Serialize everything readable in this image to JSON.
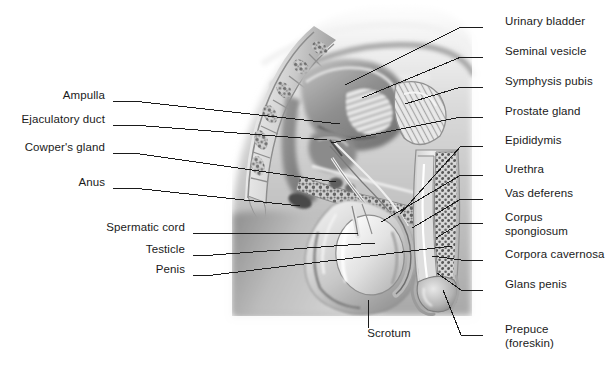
{
  "figure": {
    "width": 614,
    "height": 367,
    "background": "#ffffff",
    "leader_color": "#1a1a1a",
    "text_color": "#1a1a1a"
  },
  "labels_right": [
    {
      "id": "urinary-bladder",
      "text": "Urinary bladder",
      "x": 505,
      "y": 22,
      "stub_x": 483,
      "stub_y": 27,
      "tip_x": 345,
      "tip_y": 85
    },
    {
      "id": "seminal-vesicle",
      "text": "Seminal vesicle",
      "x": 505,
      "y": 52,
      "stub_x": 483,
      "stub_y": 57,
      "tip_x": 362,
      "tip_y": 98
    },
    {
      "id": "symphysis-pubis",
      "text": "Symphysis pubis",
      "x": 505,
      "y": 82,
      "stub_x": 483,
      "stub_y": 87,
      "tip_x": 405,
      "tip_y": 104
    },
    {
      "id": "prostate-gland",
      "text": "Prostate gland",
      "x": 505,
      "y": 112,
      "stub_x": 483,
      "stub_y": 117,
      "tip_x": 331,
      "tip_y": 143
    },
    {
      "id": "epididymis",
      "text": "Epididymis",
      "x": 505,
      "y": 141,
      "stub_x": 483,
      "stub_y": 146,
      "tip_x": 400,
      "tip_y": 214
    },
    {
      "id": "urethra",
      "text": "Urethra",
      "x": 505,
      "y": 170,
      "stub_x": 483,
      "stub_y": 175,
      "tip_x": 381,
      "tip_y": 222
    },
    {
      "id": "vas-deferens",
      "text": "Vas deferens",
      "x": 505,
      "y": 194,
      "stub_x": 483,
      "stub_y": 199,
      "tip_x": 412,
      "tip_y": 228
    },
    {
      "id": "corpus-spongiosum",
      "text": "Corpus\nspongiosum",
      "x": 505,
      "y": 218,
      "stub_x": 483,
      "stub_y": 223,
      "tip_x": 436,
      "tip_y": 238
    },
    {
      "id": "corpora-cavernosa",
      "text": "Corpora cavernosa",
      "x": 505,
      "y": 255,
      "stub_x": 483,
      "stub_y": 260,
      "tip_x": 432,
      "tip_y": 256
    },
    {
      "id": "glans-penis",
      "text": "Glans penis",
      "x": 505,
      "y": 285,
      "stub_x": 483,
      "stub_y": 290,
      "tip_x": 437,
      "tip_y": 273
    },
    {
      "id": "prepuce-foreskin",
      "text": "Prepuce\n(foreskin)",
      "x": 505,
      "y": 330,
      "stub_x": 483,
      "stub_y": 335,
      "tip_x": 443,
      "tip_y": 290
    }
  ],
  "labels_left": [
    {
      "id": "ampulla",
      "text": "Ampulla",
      "right_x": 105,
      "y": 96,
      "stub_x": 113,
      "stub_y": 101,
      "tip_x": 340,
      "tip_y": 124
    },
    {
      "id": "ejaculatory-duct",
      "text": "Ejaculatory duct",
      "right_x": 105,
      "y": 120,
      "stub_x": 113,
      "stub_y": 125,
      "tip_x": 327,
      "tip_y": 140
    },
    {
      "id": "cowpers-gland",
      "text": "Cowper's gland",
      "right_x": 105,
      "y": 148,
      "stub_x": 113,
      "stub_y": 153,
      "tip_x": 336,
      "tip_y": 182
    },
    {
      "id": "anus",
      "text": "Anus",
      "right_x": 105,
      "y": 183,
      "stub_x": 113,
      "stub_y": 188,
      "tip_x": 300,
      "tip_y": 206
    },
    {
      "id": "spermatic-cord",
      "text": "Spermatic cord",
      "right_x": 185,
      "y": 228,
      "stub_x": 193,
      "stub_y": 233,
      "tip_x": 358,
      "tip_y": 233
    },
    {
      "id": "testicle",
      "text": "Testicle",
      "right_x": 185,
      "y": 250,
      "stub_x": 193,
      "stub_y": 255,
      "tip_x": 375,
      "tip_y": 243
    },
    {
      "id": "penis",
      "text": "Penis",
      "right_x": 185,
      "y": 270,
      "stub_x": 193,
      "stub_y": 275,
      "tip_x": 452,
      "tip_y": 246
    }
  ],
  "labels_bottom": [
    {
      "id": "scrotum",
      "text": "Scrotum",
      "x": 389,
      "y": 334,
      "tip_x": 368,
      "tip_y": 300,
      "stub_x": 368,
      "stub_y": 328
    }
  ]
}
